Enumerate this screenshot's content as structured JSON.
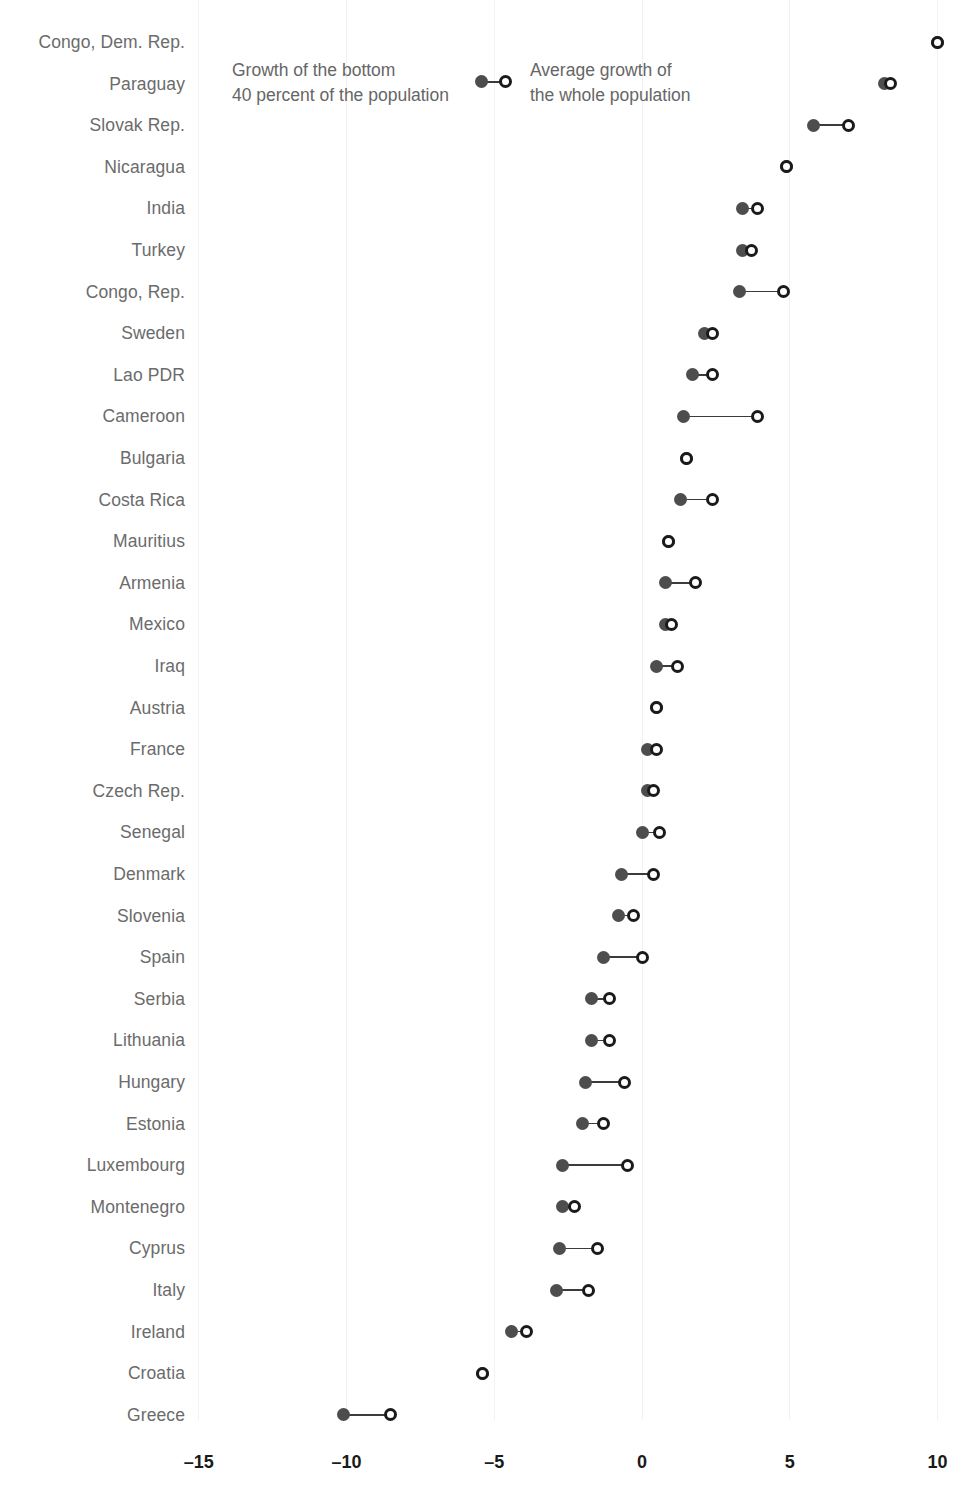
{
  "chart_data": {
    "type": "dumbbell",
    "title": "",
    "subtitle": "",
    "xlabel": "",
    "ylabel": "",
    "xlim": [
      -16.5,
      11.0
    ],
    "xticks": [
      -15,
      -10,
      -5,
      0,
      5,
      10
    ],
    "xtick_labels": [
      "–15",
      "–10",
      "–5",
      "0",
      "5",
      "10"
    ],
    "grid": "vertical-faint",
    "legend_position": "top-left-inside",
    "series": [
      {
        "name": "Growth of the bottom 40 percent of the population",
        "marker": "filled-circle",
        "color": "#4d4d4d"
      },
      {
        "name": "Average growth of the whole population",
        "marker": "open-circle",
        "color": "#1a1a1a"
      }
    ],
    "categories": [
      "Congo, Dem. Rep.",
      "Paraguay",
      "Slovak Rep.",
      "Nicaragua",
      "India",
      "Turkey",
      "Congo, Rep.",
      "Sweden",
      "Lao PDR",
      "Cameroon",
      "Bulgaria",
      "Costa Rica",
      "Mauritius",
      "Armenia",
      "Mexico",
      "Iraq",
      "Austria",
      "France",
      "Czech Rep.",
      "Senegal",
      "Denmark",
      "Slovenia",
      "Spain",
      "Serbia",
      "Lithuania",
      "Hungary",
      "Estonia",
      "Luxembourg",
      "Montenegro",
      "Cyprus",
      "Italy",
      "Ireland",
      "Croatia",
      "Greece"
    ],
    "rows": [
      {
        "country": "Congo, Dem. Rep.",
        "bottom40": 10.0,
        "average": 10.0
      },
      {
        "country": "Paraguay",
        "bottom40": 8.2,
        "average": 8.4
      },
      {
        "country": "Slovak Rep.",
        "bottom40": 5.8,
        "average": 7.0
      },
      {
        "country": "Nicaragua",
        "bottom40": 4.9,
        "average": 4.9
      },
      {
        "country": "India",
        "bottom40": 3.4,
        "average": 3.9
      },
      {
        "country": "Turkey",
        "bottom40": 3.4,
        "average": 3.7
      },
      {
        "country": "Congo, Rep.",
        "bottom40": 3.3,
        "average": 4.8
      },
      {
        "country": "Sweden",
        "bottom40": 2.1,
        "average": 2.4
      },
      {
        "country": "Lao PDR",
        "bottom40": 1.7,
        "average": 2.4
      },
      {
        "country": "Cameroon",
        "bottom40": 1.4,
        "average": 3.9
      },
      {
        "country": "Bulgaria",
        "bottom40": 1.5,
        "average": 1.5
      },
      {
        "country": "Costa Rica",
        "bottom40": 1.3,
        "average": 2.4
      },
      {
        "country": "Mauritius",
        "bottom40": 0.9,
        "average": 0.9
      },
      {
        "country": "Armenia",
        "bottom40": 0.8,
        "average": 1.8
      },
      {
        "country": "Mexico",
        "bottom40": 0.8,
        "average": 1.0
      },
      {
        "country": "Iraq",
        "bottom40": 0.5,
        "average": 1.2
      },
      {
        "country": "Austria",
        "bottom40": 0.5,
        "average": 0.5
      },
      {
        "country": "France",
        "bottom40": 0.2,
        "average": 0.5
      },
      {
        "country": "Czech Rep.",
        "bottom40": 0.2,
        "average": 0.4
      },
      {
        "country": "Senegal",
        "bottom40": 0.0,
        "average": 0.6
      },
      {
        "country": "Denmark",
        "bottom40": -0.7,
        "average": 0.4
      },
      {
        "country": "Slovenia",
        "bottom40": -0.8,
        "average": -0.3
      },
      {
        "country": "Spain",
        "bottom40": -1.3,
        "average": 0.0
      },
      {
        "country": "Serbia",
        "bottom40": -1.7,
        "average": -1.1
      },
      {
        "country": "Lithuania",
        "bottom40": -1.7,
        "average": -1.1
      },
      {
        "country": "Hungary",
        "bottom40": -1.9,
        "average": -0.6
      },
      {
        "country": "Estonia",
        "bottom40": -2.0,
        "average": -1.3
      },
      {
        "country": "Luxembourg",
        "bottom40": -2.7,
        "average": -0.5
      },
      {
        "country": "Montenegro",
        "bottom40": -2.7,
        "average": -2.3
      },
      {
        "country": "Cyprus",
        "bottom40": -2.8,
        "average": -1.5
      },
      {
        "country": "Italy",
        "bottom40": -2.9,
        "average": -1.8
      },
      {
        "country": "Ireland",
        "bottom40": -4.4,
        "average": -3.9
      },
      {
        "country": "Croatia",
        "bottom40": -5.4,
        "average": -5.4
      },
      {
        "country": "Greece",
        "bottom40": -10.1,
        "average": -8.5
      }
    ]
  },
  "legend": {
    "bottom40": {
      "line1": "Growth of the bottom",
      "line2": "40 percent of the population"
    },
    "average": {
      "line1": "Average growth of",
      "line2": "the whole population"
    }
  },
  "axis": {
    "ticks": [
      "–15",
      "–10",
      "–5",
      "0",
      "5",
      "10"
    ]
  },
  "colors": {
    "filled_marker": "#4d4d4d",
    "open_marker": "#1a1a1a",
    "connector": "#3b3b3b",
    "gridline": "#f2f2f2",
    "label_text": "#6b6b6b",
    "axis_text": "#1a1a1a"
  }
}
